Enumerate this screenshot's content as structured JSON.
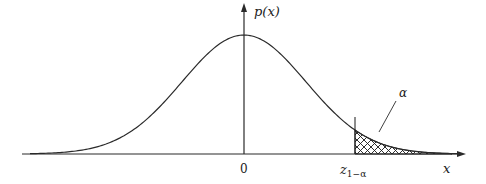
{
  "figure": {
    "type": "normal-distribution-diagram",
    "y_axis_label": "p(x)",
    "x_axis_label": "x",
    "origin_tick_label": "0",
    "critical_value_label_main": "z",
    "critical_value_label_sub": "1−α",
    "tail_area_label": "α",
    "colors": {
      "curve": "#2a2a2a",
      "axis": "#2a2a2a",
      "hatch": "#1a1a1a",
      "background": "#ffffff"
    }
  },
  "chart_data": {
    "type": "area",
    "title": "",
    "xlabel": "x",
    "ylabel": "p(x)",
    "curve": "standard normal density",
    "x_ticks": [
      "0",
      "z_{1-α}"
    ],
    "shaded_region": {
      "from": "z_{1-α}",
      "to": "+∞",
      "pattern": "crosshatch",
      "label": "α"
    },
    "grid": false,
    "legend": null
  }
}
